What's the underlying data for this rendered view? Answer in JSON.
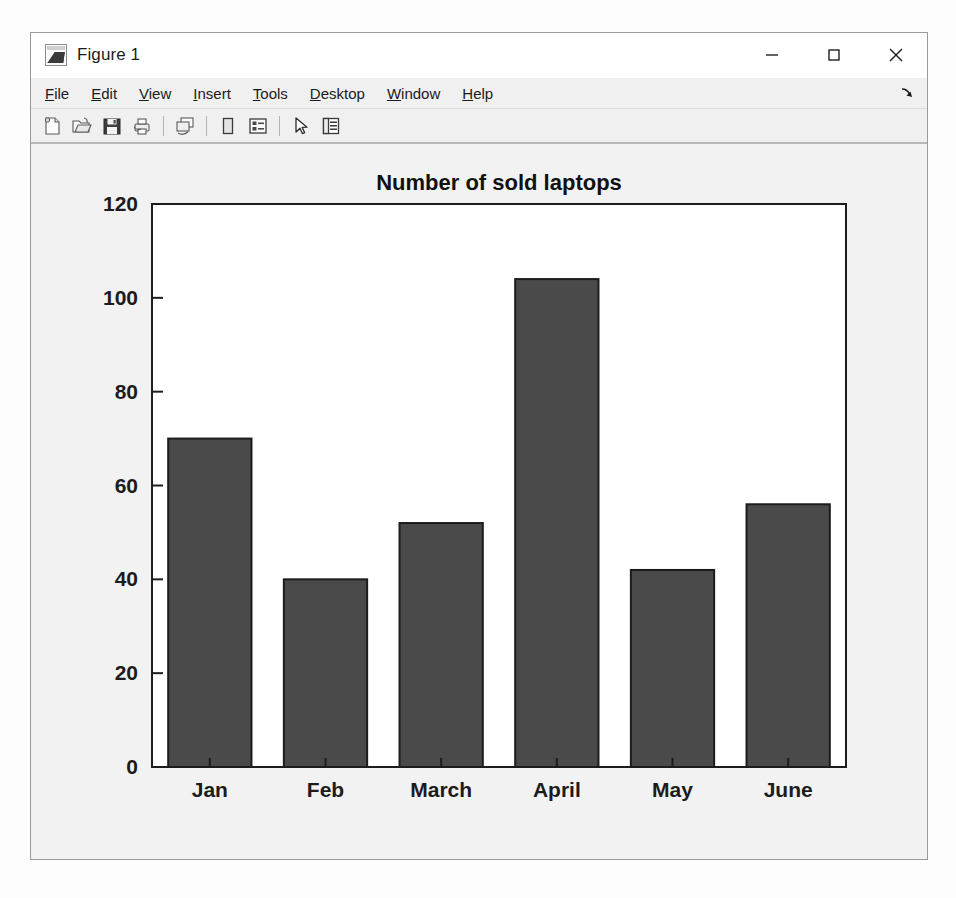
{
  "window": {
    "title": "Figure 1",
    "icon_name": "matlab-figure-icon",
    "controls": [
      {
        "name": "minimize-button",
        "label": "—",
        "tooltip": "Minimize"
      },
      {
        "name": "maximize-button",
        "label": "□",
        "tooltip": "Maximize"
      },
      {
        "name": "close-button",
        "label": "✕",
        "tooltip": "Close"
      }
    ]
  },
  "menu": {
    "items": [
      {
        "name": "menu-file",
        "pre": "",
        "mnemonic": "F",
        "post": "ile"
      },
      {
        "name": "menu-edit",
        "pre": "",
        "mnemonic": "E",
        "post": "dit"
      },
      {
        "name": "menu-view",
        "pre": "",
        "mnemonic": "V",
        "post": "iew"
      },
      {
        "name": "menu-insert",
        "pre": "",
        "mnemonic": "I",
        "post": "nsert"
      },
      {
        "name": "menu-tools",
        "pre": "",
        "mnemonic": "T",
        "post": "ools"
      },
      {
        "name": "menu-desktop",
        "pre": "",
        "mnemonic": "D",
        "post": "esktop"
      },
      {
        "name": "menu-window",
        "pre": "",
        "mnemonic": "W",
        "post": "indow"
      },
      {
        "name": "menu-help",
        "pre": "",
        "mnemonic": "H",
        "post": "elp"
      }
    ],
    "dock_arrow_label": "Undock figure"
  },
  "toolbar": {
    "buttons": [
      {
        "name": "new-figure-icon",
        "tooltip": "New Figure"
      },
      {
        "name": "open-file-icon",
        "tooltip": "Open File"
      },
      {
        "name": "save-figure-icon",
        "tooltip": "Save Figure"
      },
      {
        "name": "print-figure-icon",
        "tooltip": "Print Figure"
      },
      {
        "name": "separator",
        "tooltip": ""
      },
      {
        "name": "link-plot-icon",
        "tooltip": "Link Plot"
      },
      {
        "name": "separator",
        "tooltip": ""
      },
      {
        "name": "insert-colorbar-icon",
        "tooltip": "Insert Colorbar"
      },
      {
        "name": "insert-legend-icon",
        "tooltip": "Insert Legend"
      },
      {
        "name": "separator",
        "tooltip": ""
      },
      {
        "name": "edit-plot-pointer-icon",
        "tooltip": "Edit Plot"
      },
      {
        "name": "property-inspector-icon",
        "tooltip": "Open Property Inspector"
      }
    ]
  },
  "colors": {
    "bar_fill": "#4a4a4a",
    "bar_edge": "#1c1c1c",
    "axes_line": "#1c1c1c",
    "axes_background": "#ffffff",
    "figure_background": "#f2f2f2",
    "window_chrome": "#f0f0f0"
  },
  "chart_data": {
    "type": "bar",
    "title": "Number of sold laptops",
    "categories": [
      "Jan",
      "Feb",
      "March",
      "April",
      "May",
      "June"
    ],
    "values": [
      70,
      40,
      52,
      104,
      42,
      56
    ],
    "xlabel": "",
    "ylabel": "",
    "ylim": [
      0,
      120
    ],
    "yticks": [
      0,
      20,
      40,
      60,
      80,
      100,
      120
    ],
    "ytick_labels": [
      "0",
      "20",
      "40",
      "60",
      "80",
      "100",
      "120"
    ],
    "grid": false,
    "legend": null,
    "bar_color": "#4a4a4a",
    "bar_width_ratio": 0.72
  }
}
